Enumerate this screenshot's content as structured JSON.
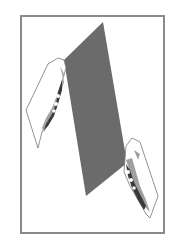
{
  "illustration": {
    "subject": "Two hands holding a sheet",
    "sheet_color": "#6b6b6b",
    "frame_color": "#8a8a8a",
    "hand_outline_color": "#777777",
    "hand_shadow_color": "#3a3a3a",
    "hand_midtone_color": "#a0a0a0"
  }
}
